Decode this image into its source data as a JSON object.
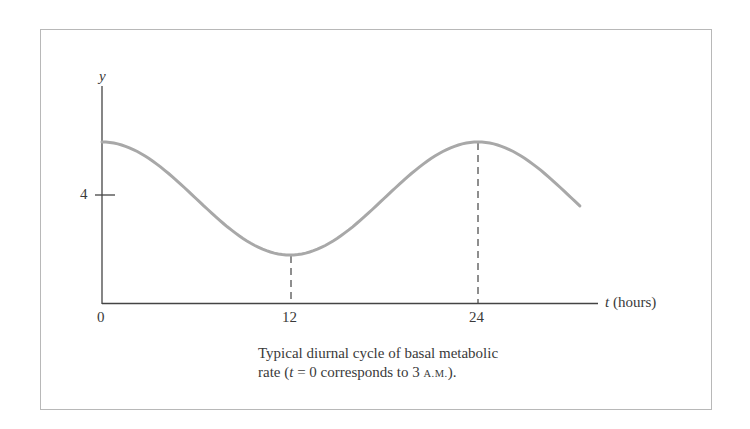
{
  "chart_data": {
    "type": "line",
    "title": "",
    "caption": {
      "line1": "Typical diurnal cycle of basal metabolic",
      "line2_prefix": "rate (",
      "line2_var": "t",
      "line2_mid": " = 0  corresponds to 3 ",
      "line2_sc": "A.M.",
      "line2_suffix": ")."
    },
    "xlabel": "t (hours)",
    "xlabel_var": "t",
    "xlabel_unit": "(hours)",
    "ylabel": "y",
    "x_ticks": [
      "0",
      "12",
      "24"
    ],
    "y_ticks": [
      "4"
    ],
    "xlim": [
      0,
      30.5
    ],
    "series": [
      {
        "name": "basal metabolic rate",
        "x": [
          0,
          3,
          6,
          9,
          12,
          15,
          18,
          21,
          24,
          27,
          30.5
        ],
        "values": [
          5.0,
          4.85,
          4.4,
          3.85,
          3.6,
          3.85,
          4.4,
          4.85,
          5.0,
          4.85,
          4.05
        ]
      }
    ],
    "reference_lines": [
      {
        "x": 12,
        "style": "dashed",
        "from": "axis",
        "to": "minimum"
      },
      {
        "x": 24,
        "style": "dashed",
        "from": "axis",
        "to": "maximum"
      }
    ],
    "grid": false,
    "legend": "none"
  },
  "colors": {
    "curve": "#a8a8a8",
    "axis": "#444444",
    "frame": "#b8b8b8"
  }
}
